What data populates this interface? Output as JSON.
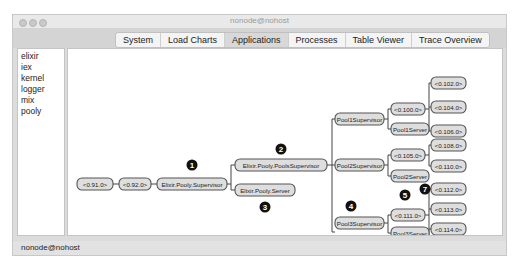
{
  "window": {
    "title": "nonode@nohost"
  },
  "tabs": [
    {
      "label": "System",
      "active": false
    },
    {
      "label": "Load Charts",
      "active": false
    },
    {
      "label": "Applications",
      "active": true
    },
    {
      "label": "Processes",
      "active": false
    },
    {
      "label": "Table Viewer",
      "active": false
    },
    {
      "label": "Trace Overview",
      "active": false
    }
  ],
  "applications": [
    "elixir",
    "iex",
    "kernel",
    "logger",
    "mix",
    "pooly"
  ],
  "tree": {
    "nodes": [
      {
        "id": "n91",
        "label": "<0.91.0>"
      },
      {
        "id": "n92",
        "label": "<0.92.0>"
      },
      {
        "id": "sup",
        "label": "Elixir.Pooly.Supervisor"
      },
      {
        "id": "pools",
        "label": "Elixir.Pooly.PoolsSupervisor"
      },
      {
        "id": "server",
        "label": "Elixir.Pooly.Server"
      },
      {
        "id": "p1sup",
        "label": "Pool1Supervisor"
      },
      {
        "id": "p2sup",
        "label": "Pool2Supervisor"
      },
      {
        "id": "p3sup",
        "label": "Pool3Supervisor"
      },
      {
        "id": "n100",
        "label": "<0.100.0>"
      },
      {
        "id": "p1srv",
        "label": "Pool1Server"
      },
      {
        "id": "n105",
        "label": "<0.105.0>"
      },
      {
        "id": "p2srv",
        "label": "Pool2Server"
      },
      {
        "id": "n111",
        "label": "<0.111.0>"
      },
      {
        "id": "p3srv",
        "label": "Pool3Server"
      },
      {
        "id": "n102",
        "label": "<0.102.0>"
      },
      {
        "id": "n104",
        "label": "<0.104.0>"
      },
      {
        "id": "n106",
        "label": "<0.106.0>"
      },
      {
        "id": "n108",
        "label": "<0.108.0>"
      },
      {
        "id": "n110",
        "label": "<0.110.0>"
      },
      {
        "id": "n112",
        "label": "<0.112.0>"
      },
      {
        "id": "n113",
        "label": "<0.113.0>"
      },
      {
        "id": "n114",
        "label": "<0.114.0>"
      },
      {
        "id": "n115",
        "label": "<0.115.0>"
      }
    ],
    "markers": [
      "1",
      "2",
      "3",
      "4",
      "5",
      "6",
      "7"
    ]
  },
  "status": {
    "node": "nonode@nohost"
  }
}
